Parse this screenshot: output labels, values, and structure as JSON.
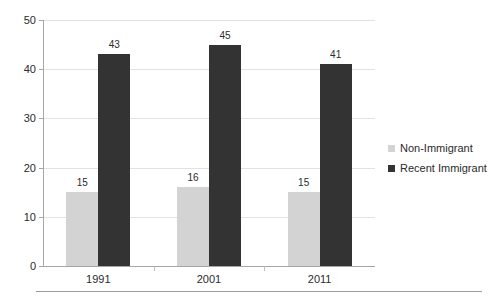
{
  "chart_data": {
    "type": "bar",
    "title": "",
    "subtitle": "",
    "xlabel": "",
    "ylabel": "",
    "categories": [
      "1991",
      "2001",
      "2011"
    ],
    "series": [
      {
        "name": "Non-Immigrant",
        "color": "#d3d3d3",
        "values": [
          15,
          16,
          15
        ]
      },
      {
        "name": "Recent Immigrant",
        "color": "#333333",
        "values": [
          43,
          45,
          41
        ]
      }
    ],
    "ylim": [
      0,
      50
    ],
    "ytick_labels": [
      "0",
      "10",
      "20",
      "30",
      "40",
      "50"
    ],
    "ytick_values": [
      0,
      10,
      20,
      30,
      40,
      50
    ],
    "grid": true,
    "grid_axis": "y",
    "legend_position": "right",
    "data_labels": true,
    "background_color": "#ffffff",
    "axis_color": "#a6a6a6",
    "gridline_color": "#e2e2e2",
    "text_color": "#2b2b2b"
  }
}
